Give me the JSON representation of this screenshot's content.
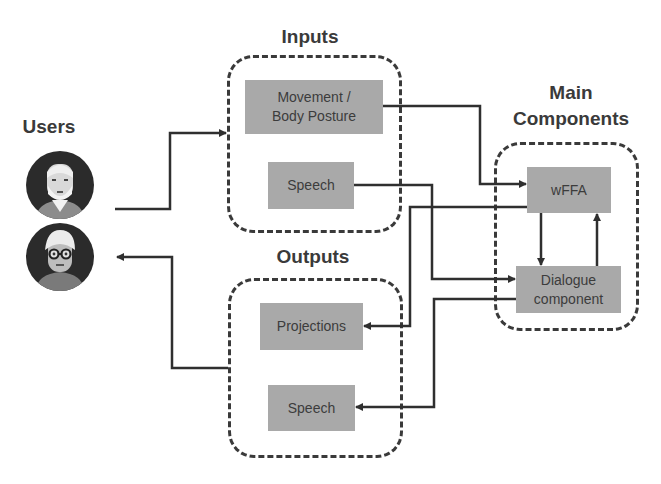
{
  "titles": {
    "users": "Users",
    "inputs": "Inputs",
    "outputs": "Outputs",
    "main_line1": "Main",
    "main_line2": "Components"
  },
  "inputs": {
    "movement_line1": "Movement /",
    "movement_line2": "Body Posture",
    "speech": "Speech"
  },
  "outputs": {
    "projections": "Projections",
    "speech": "Speech"
  },
  "main_components": {
    "wffa": "wFFA",
    "dialogue_line1": "Dialogue",
    "dialogue_line2": "component"
  },
  "users": [
    {
      "name": "user-avatar-man",
      "icon": "elderly-man-avatar-icon"
    },
    {
      "name": "user-avatar-woman",
      "icon": "elderly-woman-with-glasses-avatar-icon"
    }
  ],
  "colors": {
    "line": "#2f2f2f",
    "node_fill": "#a9a9a9",
    "text": "#3a3a3a"
  }
}
